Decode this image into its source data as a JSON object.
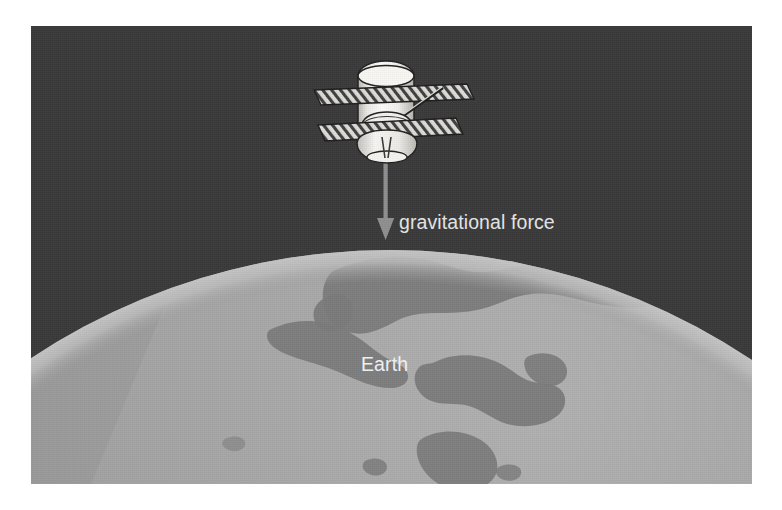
{
  "figure": {
    "background_color": "#ffffff",
    "panel": {
      "sky_color": "#3a3a3a",
      "left": 31,
      "top": 26,
      "width": 721,
      "height": 458
    }
  },
  "labels": {
    "gravitational_force": "gravitational force",
    "earth": "Earth"
  },
  "objects": {
    "satellite": {
      "name": "satellite",
      "body_color": "#f0efec",
      "outline_color": "#262626",
      "panel_fill": "#d8d6d2",
      "hatch_color": "#3c3c3c",
      "parts": [
        "upper-cylinder-body",
        "upper-solar-panel",
        "mid-tapered-section",
        "lower-solar-panel",
        "bottom-dish-antenna",
        "boom-antenna"
      ]
    },
    "force_arrow": {
      "name": "gravitational-force-arrow",
      "direction": "down",
      "color": "#8f8f8f",
      "start_y": 156,
      "end_y": 222
    },
    "earth": {
      "name": "earth-sphere",
      "ocean_color": "#9c9c9c",
      "land_color": "#7b7b7b",
      "limb_highlight_color": "#adadad",
      "terminator_shadow_color": "#6f6f6f",
      "center_x": 390,
      "center_y": 900,
      "radius": 650
    }
  },
  "colors": {
    "sky": "#3a3a3a",
    "ocean": "#9c9c9c",
    "land": "#7b7b7b",
    "label_text": "#e6e6e6",
    "earth_label_text": "#f2f2f2",
    "arrow": "#8f8f8f",
    "frame": "#ffffff"
  }
}
